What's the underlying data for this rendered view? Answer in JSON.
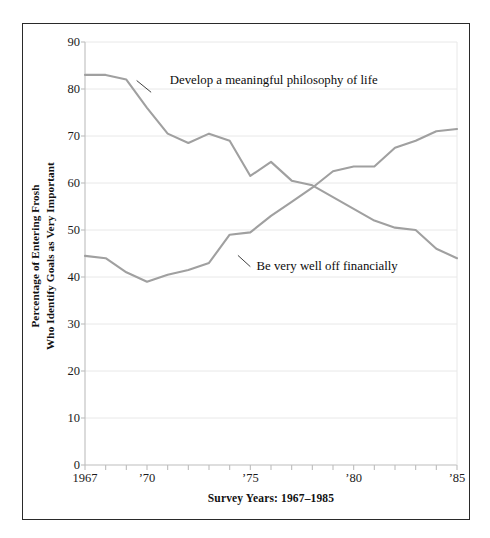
{
  "chart_data": {
    "type": "line",
    "title": "",
    "xlabel": "Survey Years: 1967–1985",
    "ylabel": "Percentage of Entering Frosh\nWho Identify Goals as Very Important",
    "ylabel_line1": "Percentage of Entering Frosh",
    "ylabel_line2": "Who Identify Goals as Very Important",
    "ylim": [
      0,
      90
    ],
    "ytick_step": 10,
    "yticks": [
      0,
      10,
      20,
      30,
      40,
      50,
      60,
      70,
      80,
      90
    ],
    "xlim": [
      1967,
      1985
    ],
    "x": [
      1967,
      1968,
      1969,
      1970,
      1971,
      1972,
      1973,
      1974,
      1975,
      1976,
      1977,
      1978,
      1979,
      1980,
      1981,
      1982,
      1983,
      1984,
      1985
    ],
    "xticks": [
      1967,
      1968,
      1969,
      1970,
      1971,
      1972,
      1973,
      1974,
      1975,
      1976,
      1977,
      1978,
      1979,
      1980,
      1981,
      1982,
      1983,
      1984,
      1985
    ],
    "xtick_labels": [
      {
        "x": 1967,
        "label": "1967"
      },
      {
        "x": 1970,
        "label": "’70"
      },
      {
        "x": 1975,
        "label": "’75"
      },
      {
        "x": 1980,
        "label": "’80"
      },
      {
        "x": 1985,
        "label": "’85"
      }
    ],
    "grid": true,
    "grid_axis": "y",
    "legend": "none",
    "series": [
      {
        "name": "Develop a meaningful philosophy of life",
        "color": "#a0a0a0",
        "values": [
          83,
          83,
          82,
          76,
          70.5,
          68.5,
          70.5,
          69,
          61.5,
          64.5,
          60.5,
          59.5,
          57,
          54.5,
          52,
          50.5,
          50,
          46,
          44
        ]
      },
      {
        "name": "Be very well off financially",
        "color": "#a0a0a0",
        "values": [
          44.5,
          44,
          41,
          39,
          40.5,
          41.5,
          43,
          49,
          49.5,
          53,
          56,
          59,
          62.5,
          63.5,
          63.5,
          67.5,
          69,
          71,
          71.5
        ]
      }
    ],
    "annotations": [
      {
        "id": "philosophy-label",
        "text": "Develop a meaningful philosophy of life",
        "label_x": 1971.1,
        "label_y": 81.8,
        "leader_from_x": 1970.2,
        "leader_from_y": 79.3,
        "leader_to_x": 1969.5,
        "leader_to_y": 81.8
      },
      {
        "id": "financial-label",
        "text": "Be very well off financially",
        "label_x": 1975.3,
        "label_y": 42.2,
        "leader_from_x": 1974.4,
        "leader_from_y": 44.6,
        "leader_to_x": 1975.0,
        "leader_to_y": 42.2
      }
    ]
  },
  "style": {
    "frame_border_color": "#2a2a2a",
    "grid_color": "#e8e8e8",
    "axis_color": "#bdbdbd",
    "line_color": "#a0a0a0",
    "text_color": "#111111",
    "background": "#ffffff"
  }
}
